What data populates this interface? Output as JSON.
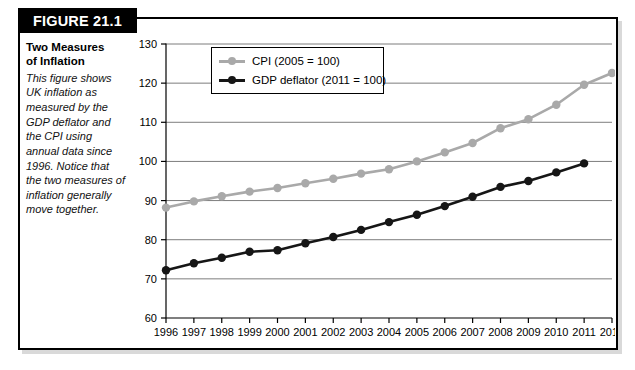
{
  "figure": {
    "tab_label": "FIGURE 21.1",
    "caption_title_line1": "Two Measures",
    "caption_title_line2": "of Inflation",
    "caption_body": "This figure shows UK inflation as measured by the GDP deflator and the CPI using annual data since 1996. Notice that the two measures of inflation generally move together."
  },
  "colors": {
    "cpi": "#a9a9a9",
    "gdp_deflator": "#161616",
    "frame": "#000000",
    "gridline": "#7d7d7d",
    "tab_background": "#000000",
    "tab_text": "#ffffff"
  },
  "chart_data": {
    "type": "line",
    "title": "",
    "xlabel": "",
    "ylabel": "",
    "xlim": [
      1996,
      2012
    ],
    "ylim": [
      60,
      130
    ],
    "ytick_step": 10,
    "grid": true,
    "legend_position": "upper-center",
    "x": [
      1996,
      1997,
      1998,
      1999,
      2000,
      2001,
      2002,
      2003,
      2004,
      2005,
      2006,
      2007,
      2008,
      2009,
      2010,
      2011,
      2012
    ],
    "categories": [
      "1996",
      "1997",
      "1998",
      "1999",
      "2000",
      "2001",
      "2002",
      "2003",
      "2004",
      "2005",
      "2006",
      "2007",
      "2008",
      "2009",
      "2010",
      "2011",
      "2012"
    ],
    "yticks": [
      60,
      70,
      80,
      90,
      100,
      110,
      120,
      130
    ],
    "ytick_labels": [
      "60",
      "70",
      "80",
      "90",
      "100",
      "110",
      "120",
      "130"
    ],
    "series": [
      {
        "name": "CPI (2005 = 100)",
        "color": "#a9a9a9",
        "values": [
          88.2,
          89.8,
          91.1,
          92.3,
          93.2,
          94.4,
          95.6,
          96.9,
          98.0,
          100.0,
          102.3,
          104.7,
          108.5,
          110.8,
          114.5,
          119.6,
          122.6
        ]
      },
      {
        "name": "GDP deflator (2011 = 100)",
        "color": "#161616",
        "values": [
          72.2,
          74.0,
          75.4,
          76.9,
          77.3,
          79.1,
          80.7,
          82.5,
          84.5,
          86.4,
          88.6,
          91.0,
          93.5,
          95.0,
          97.2,
          99.5,
          null
        ]
      }
    ],
    "legend": [
      "CPI (2005 = 100)",
      "GDP deflator (2011 = 100)"
    ]
  }
}
